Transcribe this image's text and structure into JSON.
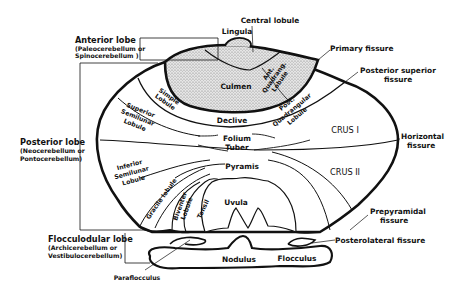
{
  "diagram": {
    "colors": {
      "ink": "#111111",
      "stipple": "#bdbdbd",
      "background": "#ffffff"
    },
    "lobes": {
      "anterior": {
        "name": "Anterior lobe",
        "alt1": "(Paleocerebellum or",
        "alt2": "Spinocerebellum )"
      },
      "posterior": {
        "name": "Posterior lobe",
        "alt1": "(Neocerebellum or",
        "alt2": "Pontocerebellum)"
      },
      "flocculonodular": {
        "name": "Flocculodular lobe",
        "alt1": "(Archicerebellum or",
        "alt2": "Vestibulocerebellum)"
      }
    },
    "regions": {
      "lingula": "Lingula",
      "central_lobule": "Central lobule",
      "culmen": "Culmen",
      "ant_quadrang_1": "Ant.",
      "ant_quadrang_2": "Quadrang.",
      "ant_quadrang_3": "Lobule",
      "declive": "Declive",
      "simple_1": "Simple",
      "simple_2": "Lobule",
      "sup_semilunar_1": "Superior",
      "sup_semilunar_2": "Semilunar",
      "sup_semilunar_3": "Lobule",
      "post_quadrang_1": "Post.",
      "post_quadrang_2": "Quadrangular",
      "post_quadrang_3": "Lobule",
      "folium": "Folium",
      "tuber": "Tuber",
      "crus1": "CRUS  I",
      "crus2": "CRUS  II",
      "pyramis": "Pyramis",
      "inf_semilunar_1": "Inferior",
      "inf_semilunar_2": "Semilunar",
      "inf_semilunar_3": "Lobule",
      "gracile": "Gracile lobule",
      "biventer_1": "Biventer",
      "biventer_2": "Lobule",
      "tonsil": "Tonsil",
      "uvula": "Uvula",
      "nodulus": "Nodulus",
      "flocculus": "Flocculus",
      "paraflocculus": "Paraflocculus"
    },
    "fissures": {
      "primary": "Primary fissure",
      "posterior_superior_1": "Posterior superior",
      "posterior_superior_2": "fissure",
      "horizontal_1": "Horizontal",
      "horizontal_2": "fissure",
      "prepyramidal_1": "Prepyramidal",
      "prepyramidal_2": "fissure",
      "posterolateral": "Posterolateral  fissure"
    }
  }
}
